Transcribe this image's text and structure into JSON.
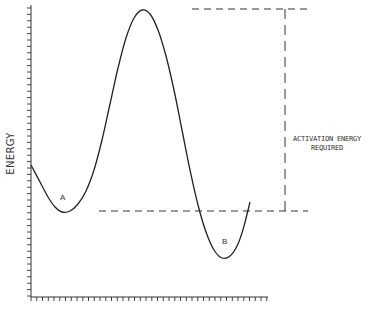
{
  "diagram": {
    "type": "energy-profile",
    "y_axis_label": "ENERGY",
    "points": {
      "A": {
        "label": "A"
      },
      "B": {
        "label": "B"
      }
    },
    "annotation": {
      "line1": "ACTIVATION ENERGY",
      "line2": "REQUIRED"
    },
    "colors": {
      "line": "#222222",
      "background": "#ffffff"
    }
  },
  "chart_data": {
    "type": "line",
    "title": "",
    "xlabel": "",
    "ylabel": "ENERGY",
    "grid": false,
    "curve_pixels": [
      [
        31,
        165
      ],
      [
        40,
        182
      ],
      [
        48,
        197
      ],
      [
        55,
        207
      ],
      [
        62,
        212
      ],
      [
        70,
        211
      ],
      [
        78,
        204
      ],
      [
        86,
        191
      ],
      [
        94,
        170
      ],
      [
        102,
        140
      ],
      [
        110,
        104
      ],
      [
        118,
        68
      ],
      [
        126,
        38
      ],
      [
        134,
        18
      ],
      [
        142,
        10
      ],
      [
        150,
        14
      ],
      [
        158,
        30
      ],
      [
        166,
        56
      ],
      [
        174,
        90
      ],
      [
        182,
        130
      ],
      [
        190,
        170
      ],
      [
        198,
        205
      ],
      [
        206,
        232
      ],
      [
        214,
        250
      ],
      [
        222,
        258
      ],
      [
        230,
        256
      ],
      [
        238,
        244
      ],
      [
        244,
        226
      ],
      [
        250,
        202
      ]
    ],
    "annotations": [
      {
        "text": "A",
        "meaning": "initial state minimum"
      },
      {
        "text": "B",
        "meaning": "final state minimum"
      },
      {
        "text": "ACTIVATION ENERGY REQUIRED",
        "meaning": "difference between peak and level of A"
      }
    ]
  }
}
